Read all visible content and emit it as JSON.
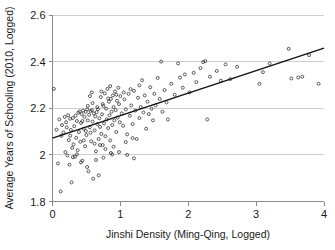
{
  "chart_data": {
    "type": "scatter",
    "title": "",
    "xlabel": "Jinshi Density (Ming-Qing, Logged)",
    "ylabel": "Average Years of Schooling (2010, Logged)",
    "xlim": [
      0,
      4
    ],
    "ylim": [
      1.8,
      2.6
    ],
    "xticks": [
      0,
      1,
      2,
      3,
      4
    ],
    "xtick_labels": [
      "0",
      "1",
      "2",
      "3",
      "4"
    ],
    "yticks": [
      1.8,
      2.0,
      2.2,
      2.4,
      2.6
    ],
    "ytick_labels": [
      "1.8",
      "2",
      "2.2",
      "2.4",
      "2.6"
    ],
    "grid": "horizontal",
    "legend": "none",
    "marker": "open-circle",
    "marker_size": 3,
    "fit_line": {
      "type": "linear",
      "x0": 0,
      "y0": 2.072,
      "x1": 4,
      "y1": 2.458,
      "slope": 0.0965,
      "intercept": 2.072
    },
    "points": [
      [
        0.02,
        2.283
      ],
      [
        0.08,
        1.963
      ],
      [
        0.1,
        2.152
      ],
      [
        0.12,
        1.843
      ],
      [
        0.14,
        2.128
      ],
      [
        0.16,
        2.096
      ],
      [
        0.18,
        2.163
      ],
      [
        0.19,
        2.012
      ],
      [
        0.2,
        2.14
      ],
      [
        0.22,
        1.997
      ],
      [
        0.23,
        2.17
      ],
      [
        0.24,
        2.063
      ],
      [
        0.25,
        1.958
      ],
      [
        0.26,
        2.155
      ],
      [
        0.27,
        2.107
      ],
      [
        0.28,
        1.882
      ],
      [
        0.3,
        2.158
      ],
      [
        0.31,
        2.045
      ],
      [
        0.32,
        2.123
      ],
      [
        0.33,
        1.992
      ],
      [
        0.34,
        2.168
      ],
      [
        0.35,
        2.073
      ],
      [
        0.36,
        2.145
      ],
      [
        0.37,
        2.02
      ],
      [
        0.38,
        2.181
      ],
      [
        0.39,
        2.098
      ],
      [
        0.4,
        2.186
      ],
      [
        0.41,
        2.056
      ],
      [
        0.42,
        2.137
      ],
      [
        0.43,
        2.175
      ],
      [
        0.44,
        1.975
      ],
      [
        0.45,
        2.19
      ],
      [
        0.46,
        2.112
      ],
      [
        0.47,
        2.163
      ],
      [
        0.48,
        2.037
      ],
      [
        0.49,
        2.185
      ],
      [
        0.5,
        2.085
      ],
      [
        0.51,
        2.195
      ],
      [
        0.52,
        2.148
      ],
      [
        0.53,
        1.929
      ],
      [
        0.54,
        2.172
      ],
      [
        0.55,
        2.118
      ],
      [
        0.56,
        2.188
      ],
      [
        0.57,
        2.058
      ],
      [
        0.58,
        2.192
      ],
      [
        0.59,
        2.143
      ],
      [
        0.6,
        1.898
      ],
      [
        0.61,
        2.178
      ],
      [
        0.62,
        2.105
      ],
      [
        0.63,
        2.165
      ],
      [
        0.64,
        2.015
      ],
      [
        0.65,
        2.183
      ],
      [
        0.66,
        2.132
      ],
      [
        0.67,
        2.196
      ],
      [
        0.68,
        2.068
      ],
      [
        0.69,
        2.157
      ],
      [
        0.7,
        2.12
      ],
      [
        0.71,
        2.248
      ],
      [
        0.72,
        2.09
      ],
      [
        0.73,
        2.174
      ],
      [
        0.74,
        2.042
      ],
      [
        0.75,
        2.21
      ],
      [
        0.76,
        2.135
      ],
      [
        0.77,
        2.264
      ],
      [
        0.78,
        2.08
      ],
      [
        0.79,
        2.198
      ],
      [
        0.8,
        2.152
      ],
      [
        0.81,
        2.283
      ],
      [
        0.82,
        2.115
      ],
      [
        0.83,
        2.228
      ],
      [
        0.84,
        2.17
      ],
      [
        0.85,
        2.062
      ],
      [
        0.86,
        2.24
      ],
      [
        0.87,
        2.185
      ],
      [
        0.88,
        2.128
      ],
      [
        0.89,
        2.255
      ],
      [
        0.9,
        2.205
      ],
      [
        0.91,
        2.148
      ],
      [
        0.92,
        2.272
      ],
      [
        0.93,
        2.192
      ],
      [
        0.94,
        2.098
      ],
      [
        0.95,
        2.232
      ],
      [
        0.96,
        2.16
      ],
      [
        0.97,
        2.288
      ],
      [
        0.98,
        2.218
      ],
      [
        0.99,
        2.14
      ],
      [
        1.0,
        2.252
      ],
      [
        1.02,
        2.178
      ],
      [
        1.04,
        2.125
      ],
      [
        1.06,
        2.238
      ],
      [
        1.08,
        2.195
      ],
      [
        1.1,
        2.088
      ],
      [
        1.12,
        2.262
      ],
      [
        1.14,
        2.168
      ],
      [
        1.16,
        2.212
      ],
      [
        1.18,
        2.132
      ],
      [
        1.2,
        2.275
      ],
      [
        1.22,
        2.19
      ],
      [
        1.24,
        2.068
      ],
      [
        1.26,
        2.245
      ],
      [
        1.28,
        2.158
      ],
      [
        1.3,
        2.205
      ],
      [
        1.32,
        2.32
      ],
      [
        1.34,
        2.182
      ],
      [
        1.36,
        2.255
      ],
      [
        1.38,
        2.112
      ],
      [
        1.4,
        2.228
      ],
      [
        1.42,
        2.175
      ],
      [
        1.44,
        2.29
      ],
      [
        1.46,
        2.198
      ],
      [
        1.48,
        2.148
      ],
      [
        1.5,
        2.262
      ],
      [
        1.52,
        2.212
      ],
      [
        1.55,
        2.33
      ],
      [
        1.58,
        2.24
      ],
      [
        1.6,
        2.4
      ],
      [
        1.62,
        2.185
      ],
      [
        1.65,
        2.278
      ],
      [
        1.68,
        2.225
      ],
      [
        1.7,
        2.152
      ],
      [
        1.75,
        2.305
      ],
      [
        1.8,
        2.258
      ],
      [
        1.85,
        2.392
      ],
      [
        1.88,
        2.332
      ],
      [
        1.92,
        2.288
      ],
      [
        1.95,
        2.345
      ],
      [
        2.02,
        2.268
      ],
      [
        2.08,
        2.352
      ],
      [
        2.12,
        2.312
      ],
      [
        2.18,
        2.372
      ],
      [
        2.22,
        2.398
      ],
      [
        2.25,
        2.402
      ],
      [
        2.28,
        2.152
      ],
      [
        2.32,
        2.335
      ],
      [
        2.42,
        2.36
      ],
      [
        2.48,
        2.318
      ],
      [
        2.55,
        2.388
      ],
      [
        2.62,
        2.325
      ],
      [
        2.72,
        2.378
      ],
      [
        3.05,
        2.305
      ],
      [
        3.1,
        2.355
      ],
      [
        3.2,
        2.392
      ],
      [
        3.48,
        2.455
      ],
      [
        3.52,
        2.328
      ],
      [
        3.62,
        2.332
      ],
      [
        3.68,
        2.335
      ],
      [
        3.78,
        2.428
      ],
      [
        3.92,
        2.305
      ],
      [
        0.06,
        2.108
      ],
      [
        0.13,
        2.082
      ],
      [
        0.21,
        2.118
      ],
      [
        0.29,
        2.03
      ],
      [
        0.44,
        2.145
      ],
      [
        0.49,
        2.102
      ],
      [
        0.52,
        2.21
      ],
      [
        0.56,
        2.095
      ],
      [
        0.59,
        2.222
      ],
      [
        0.62,
        2.048
      ],
      [
        0.66,
        2.205
      ],
      [
        0.7,
        2.042
      ],
      [
        0.74,
        2.218
      ],
      [
        0.78,
        2.025
      ],
      [
        0.82,
        2.242
      ],
      [
        0.86,
        2.008
      ],
      [
        0.9,
        2.035
      ],
      [
        0.94,
        2.258
      ],
      [
        0.98,
        2.012
      ],
      [
        1.05,
        2.268
      ],
      [
        1.1,
        2.0
      ],
      [
        1.15,
        2.282
      ],
      [
        1.2,
        1.985
      ],
      [
        1.28,
        2.298
      ],
      [
        0.55,
        2.252
      ],
      [
        0.58,
        2.268
      ],
      [
        0.72,
        2.272
      ],
      [
        0.85,
        2.295
      ],
      [
        0.46,
        2.062
      ],
      [
        0.51,
        1.948
      ],
      [
        0.64,
        1.978
      ],
      [
        0.68,
        1.912
      ],
      [
        0.75,
        1.988
      ],
      [
        0.88,
        2.002
      ],
      [
        1.08,
        2.055
      ],
      [
        1.18,
        2.072
      ],
      [
        0.36,
        2.002
      ],
      [
        0.42,
        1.968
      ],
      [
        0.3,
        1.99
      ],
      [
        0.26,
        2.082
      ]
    ]
  }
}
